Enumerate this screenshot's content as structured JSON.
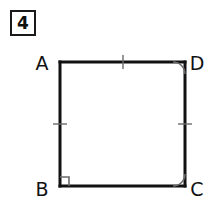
{
  "page": {
    "width": 210,
    "height": 219,
    "background_color": "#ffffff",
    "ink_color": "#111111"
  },
  "problem": {
    "number": "4",
    "box_border_color": "#1a1a1a"
  },
  "figure": {
    "type": "geometry-diagram",
    "shape": "square",
    "stroke_color": "#111111",
    "stroke_width": 3,
    "square": {
      "left": 60,
      "top": 62,
      "right": 185,
      "bottom": 186
    },
    "vertices": [
      {
        "id": "A",
        "label": "A",
        "x": 60,
        "y": 62,
        "label_x": 42,
        "label_y": 70,
        "corner": "top-left"
      },
      {
        "id": "D",
        "label": "D",
        "x": 185,
        "y": 62,
        "label_x": 190,
        "label_y": 70,
        "corner": "top-right"
      },
      {
        "id": "B",
        "label": "B",
        "x": 60,
        "y": 186,
        "label_x": 42,
        "label_y": 196,
        "corner": "bottom-left"
      },
      {
        "id": "C",
        "label": "C",
        "x": 185,
        "y": 186,
        "label_x": 190,
        "label_y": 196,
        "corner": "bottom-right"
      }
    ],
    "edges": [
      {
        "id": "AD",
        "from": "A",
        "to": "D",
        "side": "top"
      },
      {
        "id": "DC",
        "from": "D",
        "to": "C",
        "side": "right"
      },
      {
        "id": "CB",
        "from": "C",
        "to": "B",
        "side": "bottom"
      },
      {
        "id": "BA",
        "from": "B",
        "to": "A",
        "side": "left"
      }
    ],
    "congruence_ticks": [
      {
        "edge": "AD",
        "count": 1,
        "x": 123,
        "y": 62,
        "orientation": "vertical"
      },
      {
        "edge": "BA",
        "count": 1,
        "x": 60,
        "y": 124,
        "orientation": "horizontal"
      },
      {
        "edge": "DC",
        "count": 1,
        "x": 185,
        "y": 124,
        "orientation": "horizontal"
      }
    ],
    "angle_marks": [
      {
        "vertex": "B",
        "style": "right-angle-square",
        "size": 9
      },
      {
        "vertex": "C",
        "style": "arc",
        "radius": 12
      },
      {
        "vertex": "D",
        "style": "arc",
        "radius": 12
      }
    ]
  }
}
